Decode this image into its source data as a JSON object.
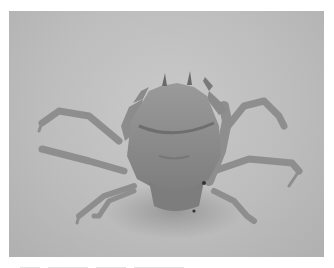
{
  "image": {
    "subject": "crab",
    "description": "Grayscale photograph of a crab on a light gray surface, viewed from the front, with spindly jointed legs spread out and two small claws raised",
    "colors": {
      "background": "#bdbdbd",
      "body": "#8a8a8a",
      "shadow": "#6f6f6f",
      "border": "#ffffff"
    }
  }
}
